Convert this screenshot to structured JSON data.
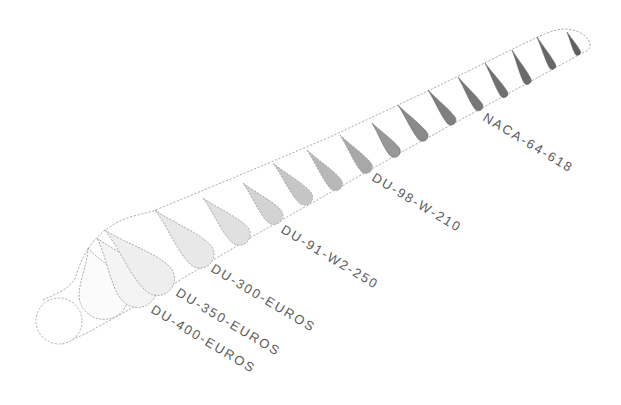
{
  "colors": {
    "background": "#ffffff",
    "outline": "#a3a3a3",
    "label": "#5a5a5a"
  },
  "sections": [
    {
      "shape": "circle",
      "fill": "#ffffff"
    },
    {
      "shape": "airfoil",
      "fill": "#fbfbfb"
    },
    {
      "shape": "airfoil",
      "fill": "#f4f4f4"
    },
    {
      "shape": "airfoil",
      "fill": "#eeeeee"
    },
    {
      "shape": "airfoil",
      "fill": "#e8e8e8"
    },
    {
      "shape": "airfoil",
      "fill": "#e0e0e0"
    },
    {
      "shape": "airfoil",
      "fill": "#d3d3d3"
    },
    {
      "shape": "airfoil",
      "fill": "#c6c6c6"
    },
    {
      "shape": "airfoil",
      "fill": "#b8b8b8"
    },
    {
      "shape": "airfoil",
      "fill": "#a8a8a8"
    },
    {
      "shape": "airfoil",
      "fill": "#989898"
    },
    {
      "shape": "airfoil",
      "fill": "#8a8a8a"
    },
    {
      "shape": "airfoil",
      "fill": "#7f7f7f"
    },
    {
      "shape": "airfoil",
      "fill": "#777777"
    },
    {
      "shape": "airfoil",
      "fill": "#707070"
    },
    {
      "shape": "airfoil",
      "fill": "#6a6a6a"
    },
    {
      "shape": "airfoil",
      "fill": "#666666"
    },
    {
      "shape": "airfoil",
      "fill": "#606060"
    }
  ],
  "labels": [
    {
      "text": "DU-400-EUROS"
    },
    {
      "text": "DU-350-EUROS"
    },
    {
      "text": "DU-300-EUROS"
    },
    {
      "text": "DU-91-W2-250"
    },
    {
      "text": "DU-98-W-210"
    },
    {
      "text": "NACA-64-618"
    }
  ]
}
